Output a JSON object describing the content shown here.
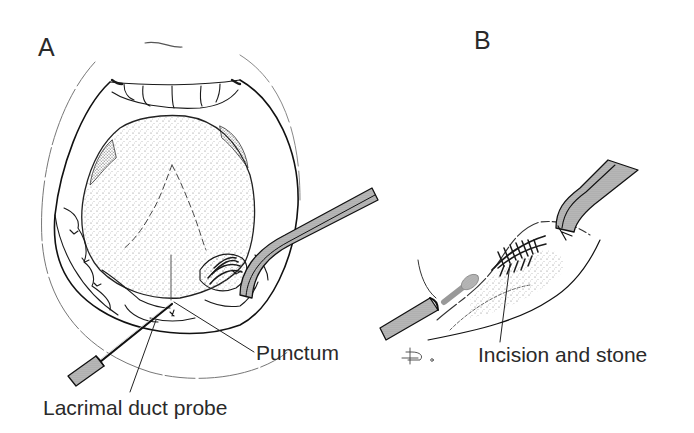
{
  "figure": {
    "panels": [
      {
        "id": "A",
        "letter": "A",
        "description": "Open mouth viewed from front; tongue elevated; forceps retracting floor of mouth; lacrimal duct probe inserted into submandibular duct punctum",
        "callouts": [
          {
            "key": "punctum",
            "text": "Punctum"
          },
          {
            "key": "probe",
            "text": "Lacrimal duct probe"
          }
        ]
      },
      {
        "id": "B",
        "letter": "B",
        "description": "Close-up of duct with probe in place, incision over the duct exposing stone, forceps retracting",
        "callouts": [
          {
            "key": "incision",
            "text": "Incision and stone"
          }
        ]
      }
    ],
    "signature": "D.",
    "colors": {
      "ink": "#1a1a1a",
      "instrument_shade": "#a9a9a9",
      "stipple": "#6e6e6e",
      "background": "#ffffff"
    }
  }
}
